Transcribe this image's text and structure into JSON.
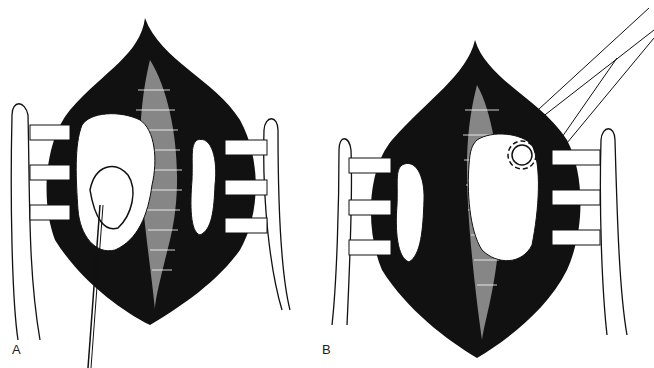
{
  "figure": {
    "panels": [
      {
        "label": "A",
        "description": "Surgical exposure with retractors; mass on left retracted with suture, smaller lobulated tissue on right"
      },
      {
        "label": "B",
        "description": "Surgical exposure with retractors; smaller lobulated tissue on left, larger mass on right grasped with forceps/ring"
      }
    ],
    "colors": {
      "ink": "#111111",
      "background": "#ffffff"
    }
  }
}
